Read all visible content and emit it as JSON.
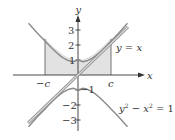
{
  "figure": {
    "type": "hyperbola-region-diagram",
    "axes": {
      "x_label": "x",
      "y_label": "y",
      "y_ticks": [
        {
          "value": 3,
          "label": "3"
        },
        {
          "value": 2,
          "label": "2"
        },
        {
          "value": 1,
          "label": "1"
        },
        {
          "value": -1,
          "label": "−1"
        },
        {
          "value": -2,
          "label": "−2"
        },
        {
          "value": -3,
          "label": "−3"
        }
      ],
      "x_marks": [
        {
          "value": -2.2,
          "label": "−c"
        },
        {
          "value": 2.2,
          "label": "c"
        }
      ]
    },
    "curves": {
      "line_label": "y = x",
      "hyperbola_label": "y² − x² = 1",
      "hyperbola_label_parts": {
        "y": "y",
        "sup1": "2",
        "minus": " − ",
        "x": "x",
        "sup2": "2",
        "rhs": " = 1"
      }
    },
    "shaded_region": "area under upper branch of hyperbola from −c to c",
    "colors": {
      "curve": "#8a8a8a",
      "axis": "#333333",
      "fill": "#e2e2e2",
      "line_inner": "#d8d8d8"
    }
  }
}
